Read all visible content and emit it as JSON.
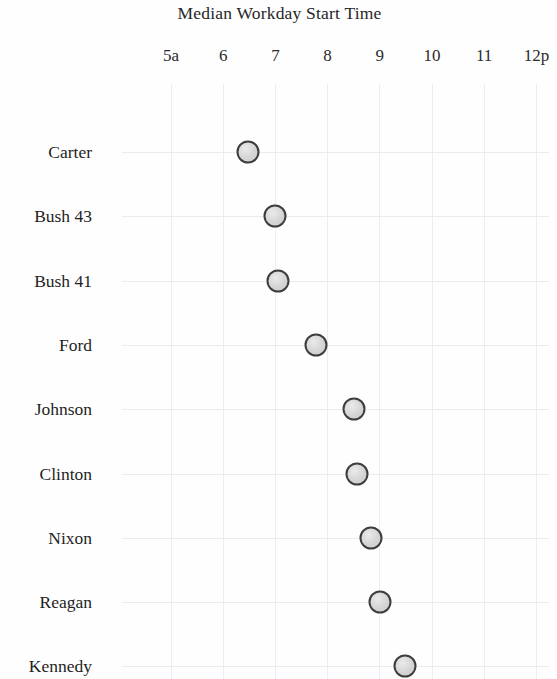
{
  "chart_data": {
    "type": "scatter",
    "title": "Median Workday Start Time",
    "xlabel": "",
    "ylabel": "",
    "orientation": "horizontal",
    "grid": true,
    "legend": null,
    "xlim": [
      5,
      12
    ],
    "x_tick_labels": [
      "5a",
      "6",
      "7",
      "8",
      "9",
      "10",
      "11",
      "12p"
    ],
    "x_tick_values": [
      5,
      6,
      7,
      8,
      9,
      10,
      11,
      12
    ],
    "categories": [
      "Carter",
      "Bush 43",
      "Bush 41",
      "Ford",
      "Johnson",
      "Clinton",
      "Nixon",
      "Reagan",
      "Kennedy"
    ],
    "values": [
      6.47,
      6.99,
      7.05,
      7.78,
      8.51,
      8.56,
      8.83,
      9.0,
      9.48
    ],
    "value_labels": [
      "6:28a",
      "6:59a",
      "7:03a",
      "7:47a",
      "8:31a",
      "8:34a",
      "8:50a",
      "9:00a",
      "9:29a"
    ],
    "points": [
      {
        "category": "Carter",
        "value": 6.47,
        "value_label": "6:28a"
      },
      {
        "category": "Bush 43",
        "value": 6.99,
        "value_label": "6:59a"
      },
      {
        "category": "Bush 41",
        "value": 7.05,
        "value_label": "7:03a"
      },
      {
        "category": "Ford",
        "value": 7.78,
        "value_label": "7:47a"
      },
      {
        "category": "Johnson",
        "value": 8.51,
        "value_label": "8:31a"
      },
      {
        "category": "Clinton",
        "value": 8.56,
        "value_label": "8:34a"
      },
      {
        "category": "Nixon",
        "value": 8.83,
        "value_label": "8:50a"
      },
      {
        "category": "Reagan",
        "value": 9.0,
        "value_label": "9:00a"
      },
      {
        "category": "Kennedy",
        "value": 9.48,
        "value_label": "9:29a"
      }
    ],
    "colors": {
      "marker_fill": "#d2d2d2",
      "marker_edge": "#3d3d3d",
      "grid": "#ececee",
      "text": "#1f1f1f",
      "background": "#fefefe"
    },
    "note_truncated_bottom": "Kennedy row is clipped at the bottom edge of the image"
  },
  "layout": {
    "x_pixel_at_5a": 171,
    "x_pixels_per_hour": 52.2,
    "first_row_y": 152,
    "row_spacing_y": 64.3,
    "grid_top_y": 84
  }
}
